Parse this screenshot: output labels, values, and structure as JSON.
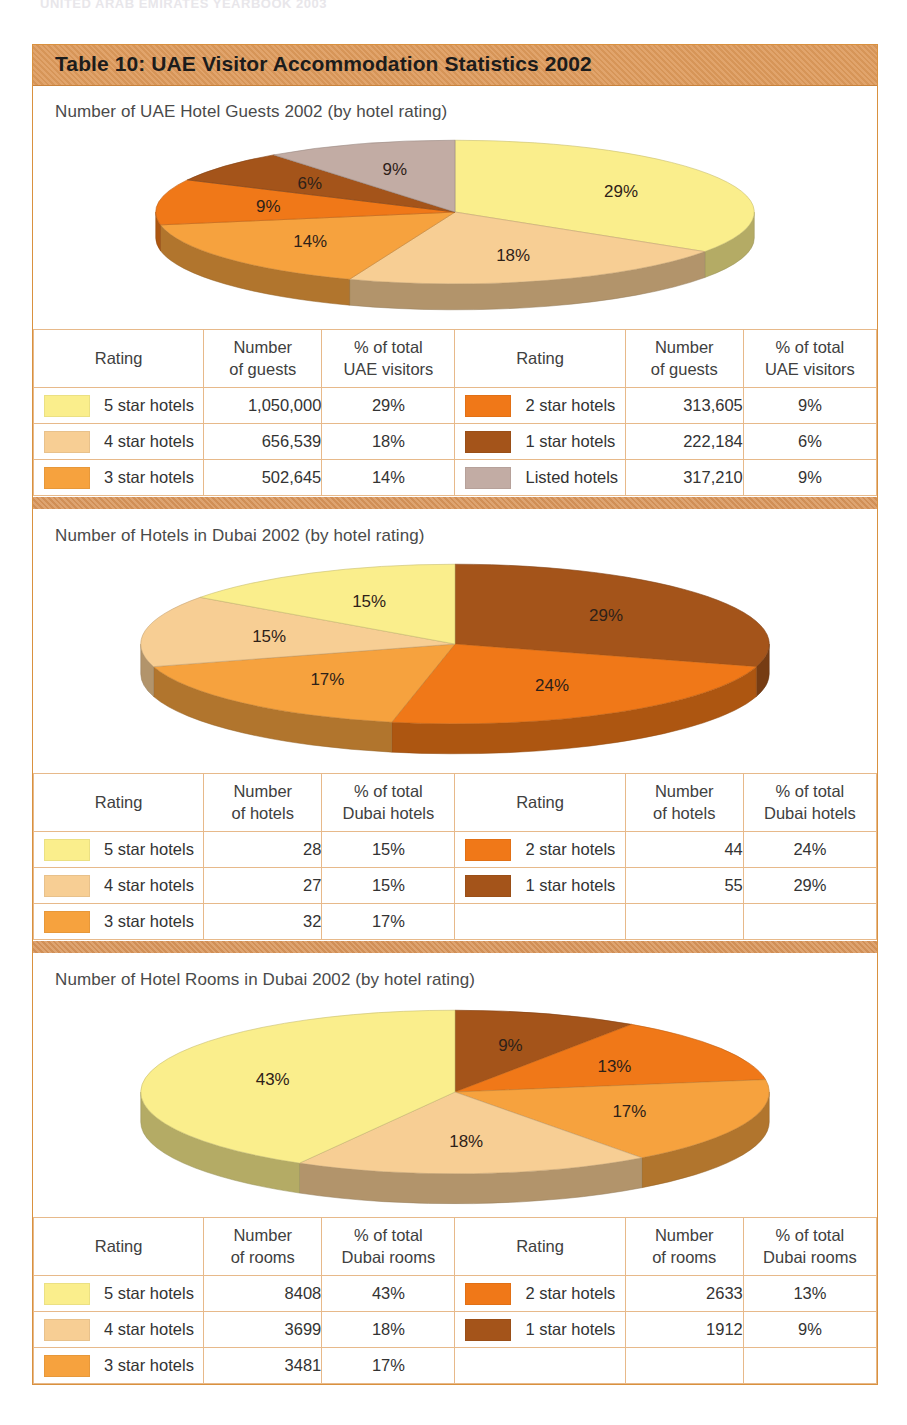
{
  "running_header": "UNITED ARAB EMIRATES YEARBOOK 2003",
  "card": {
    "title": "Table 10: UAE Visitor Accommodation Statistics 2002"
  },
  "palette": {
    "5_star": "#FAEE8C",
    "4_star": "#F7CE94",
    "3_star": "#F6A23E",
    "2_star": "#F07818",
    "1_star": "#A4541A",
    "listed": "#C2ACA4",
    "band": "#D9955A",
    "header_band": "#DE9A5B",
    "border": "#E7B98A"
  },
  "sections": [
    {
      "title": "Number of UAE Hotel Guests 2002 (by hotel rating)",
      "headers": {
        "rating": "Rating",
        "number_l1": "Number",
        "number_l2": "of guests",
        "pct_l1": "% of total",
        "pct_l2": "UAE visitors"
      },
      "left_rows": [
        {
          "label": "5 star hotels",
          "color": "#FAEE8C",
          "number": "1,050,000",
          "pct": "29%"
        },
        {
          "label": "4 star hotels",
          "color": "#F7CE94",
          "number": "656,539",
          "pct": "18%"
        },
        {
          "label": "3 star hotels",
          "color": "#F6A23E",
          "number": "502,645",
          "pct": "14%"
        }
      ],
      "right_rows": [
        {
          "label": "2 star hotels",
          "color": "#F07818",
          "number": "313,605",
          "pct": "9%"
        },
        {
          "label": "1 star hotels",
          "color": "#A4541A",
          "number": "222,184",
          "pct": "6%"
        },
        {
          "label": "Listed hotels",
          "color": "#C2ACA4",
          "number": "317,210",
          "pct": "9%"
        }
      ]
    },
    {
      "title": "Number of Hotels in Dubai 2002 (by hotel rating)",
      "headers": {
        "rating": "Rating",
        "number_l1": "Number",
        "number_l2": "of hotels",
        "pct_l1": "% of total",
        "pct_l2": "Dubai hotels"
      },
      "left_rows": [
        {
          "label": "5 star hotels",
          "color": "#FAEE8C",
          "number": "28",
          "pct": "15%"
        },
        {
          "label": "4 star hotels",
          "color": "#F7CE94",
          "number": "27",
          "pct": "15%"
        },
        {
          "label": "3 star hotels",
          "color": "#F6A23E",
          "number": "32",
          "pct": "17%"
        }
      ],
      "right_rows": [
        {
          "label": "2 star hotels",
          "color": "#F07818",
          "number": "44",
          "pct": "24%"
        },
        {
          "label": "1 star hotels",
          "color": "#A4541A",
          "number": "55",
          "pct": "29%"
        }
      ]
    },
    {
      "title": "Number of Hotel Rooms in Dubai 2002 (by hotel rating)",
      "headers": {
        "rating": "Rating",
        "number_l1": "Number",
        "number_l2": "of rooms",
        "pct_l1": "% of total",
        "pct_l2": "Dubai rooms"
      },
      "left_rows": [
        {
          "label": "5 star hotels",
          "color": "#FAEE8C",
          "number": "8408",
          "pct": "43%"
        },
        {
          "label": "4 star hotels",
          "color": "#F7CE94",
          "number": "3699",
          "pct": "18%"
        },
        {
          "label": "3 star hotels",
          "color": "#F6A23E",
          "number": "3481",
          "pct": "17%"
        }
      ],
      "right_rows": [
        {
          "label": "2 star hotels",
          "color": "#F07818",
          "number": "2633",
          "pct": "13%"
        },
        {
          "label": "1 star hotels",
          "color": "#A4541A",
          "number": "1912",
          "pct": "9%"
        }
      ]
    }
  ],
  "chart_data": [
    {
      "type": "pie",
      "title": "Number of UAE Hotel Guests 2002 (by hotel rating)",
      "categories": [
        "5 star hotels",
        "4 star hotels",
        "3 star hotels",
        "2 star hotels",
        "1 star hotels",
        "Listed hotels"
      ],
      "values": [
        1050000,
        656539,
        502645,
        313605,
        222184,
        317210
      ],
      "percent_labels": [
        "29%",
        "18%",
        "14%",
        "9%",
        "6%",
        "9%"
      ],
      "colors": [
        "#FAEE8C",
        "#F7CE94",
        "#F6A23E",
        "#F07818",
        "#A4541A",
        "#C2ACA4"
      ],
      "start_angle_deg": 0,
      "direction": "clockwise",
      "three_d": true,
      "legend": "table-below"
    },
    {
      "type": "pie",
      "title": "Number of Hotels in Dubai 2002 (by hotel rating)",
      "categories": [
        "1 star hotels",
        "2 star hotels",
        "3 star hotels",
        "4 star hotels",
        "5 star hotels"
      ],
      "values": [
        55,
        44,
        32,
        27,
        28
      ],
      "percent_labels": [
        "29%",
        "24%",
        "17%",
        "15%",
        "15%"
      ],
      "colors": [
        "#A4541A",
        "#F07818",
        "#F6A23E",
        "#F7CE94",
        "#FAEE8C"
      ],
      "start_angle_deg": 0,
      "direction": "clockwise",
      "three_d": true,
      "legend": "table-below"
    },
    {
      "type": "pie",
      "title": "Number of Hotel Rooms in Dubai 2002 (by hotel rating)",
      "categories": [
        "1 star hotels",
        "2 star hotels",
        "3 star hotels",
        "4 star hotels",
        "5 star hotels"
      ],
      "values": [
        1912,
        2633,
        3481,
        3699,
        8408
      ],
      "percent_labels": [
        "9%",
        "13%",
        "17%",
        "18%",
        "43%"
      ],
      "colors": [
        "#A4541A",
        "#F07818",
        "#F6A23E",
        "#F7CE94",
        "#FAEE8C"
      ],
      "start_angle_deg": 0,
      "direction": "clockwise",
      "three_d": true,
      "legend": "table-below"
    }
  ]
}
